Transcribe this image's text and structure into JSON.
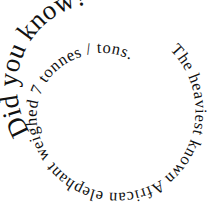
{
  "spiral": {
    "headline": "Did you know?",
    "body": "The heaviest known African elephant weighed 7 tonnes / tons."
  },
  "colors": {
    "text": "#111111",
    "background": "#ffffff"
  }
}
